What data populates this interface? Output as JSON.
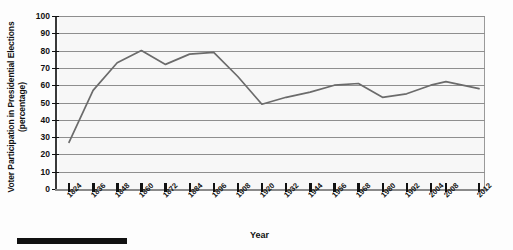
{
  "chart_data": {
    "type": "line",
    "title": "",
    "xlabel": "Year",
    "ylabel": "Voter Participation in Presidential Elections (percentage)",
    "ylim": [
      0,
      100
    ],
    "ytick_labels": [
      "0",
      "10",
      "20",
      "30",
      "40",
      "50",
      "60",
      "70",
      "80",
      "90",
      "100"
    ],
    "ytick_values": [
      0,
      10,
      20,
      30,
      40,
      50,
      60,
      70,
      80,
      90,
      100
    ],
    "grid": true,
    "legend": "none",
    "categories": [
      "1824",
      "1836",
      "1848",
      "1860",
      "1872",
      "1884",
      "1896",
      "1908",
      "1920",
      "1932",
      "1944",
      "1956",
      "1968",
      "1980",
      "1992",
      "2004",
      "2008",
      "2012"
    ],
    "values": [
      27,
      57,
      73,
      80,
      72,
      78,
      79,
      65,
      49,
      53,
      56,
      60,
      61,
      53,
      55,
      60,
      62,
      58
    ],
    "series": [
      {
        "name": "Voter participation",
        "color": "#6b6b6b",
        "values": [
          27,
          57,
          73,
          80,
          72,
          78,
          79,
          65,
          49,
          53,
          56,
          60,
          61,
          53,
          55,
          60,
          62,
          58
        ]
      }
    ]
  },
  "axes": {
    "y_title": "Voter Participation in Presidential Elections (percentage)",
    "x_title": "Year"
  },
  "colors": {
    "line": "#6b6b6b",
    "grid": "#8e8e8e",
    "plot_background": "#f7f7f7",
    "text": "#111111"
  }
}
